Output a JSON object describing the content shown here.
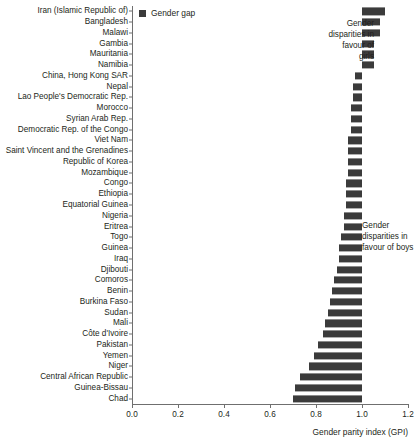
{
  "legend": {
    "label": "Gender gap",
    "swatch_color": "#3b3b3b"
  },
  "annotations": {
    "girls": "Gender disparities in favour of girls",
    "boys": "Gender disparities in favour of boys"
  },
  "axis": {
    "x_title": "Gender parity index (GPI)",
    "x_ticks": [
      "0.0",
      "0.2",
      "0.4",
      "0.6",
      "0.8",
      "1.0",
      "1.2"
    ]
  },
  "chart_data": {
    "type": "bar",
    "orientation": "horizontal",
    "title": "",
    "xlabel": "Gender parity index (GPI)",
    "ylabel": "",
    "xlim": [
      0.0,
      1.2
    ],
    "xticks": [
      0.0,
      0.2,
      0.4,
      0.6,
      0.8,
      1.0,
      1.2
    ],
    "grid": false,
    "legend_position": "top-left",
    "reference_line": 1.0,
    "series_name": "Gender gap",
    "bar_color": "#3b3b3b",
    "note": "Bars are drawn as the gap between the country GPI value and parity (1.00). Values above 1.00 extend right (disparities in favour of girls); values below 1.00 extend left (disparities in favour of boys).",
    "categories": [
      "Iran (Islamic Republic of)",
      "Bangladesh",
      "Malawi",
      "Gambia",
      "Mauritania",
      "Namibia",
      "China, Hong Kong SAR",
      "Nepal",
      "Lao People's Democratic Rep.",
      "Morocco",
      "Syrian Arab Rep.",
      "Democratic Rep. of the Congo",
      "Viet Nam",
      "Saint Vincent and the Grenadines",
      "Republic of Korea",
      "Mozambique",
      "Congo",
      "Ethiopia",
      "Equatorial Guinea",
      "Nigeria",
      "Eritrea",
      "Togo",
      "Guinea",
      "Iraq",
      "Djibouti",
      "Comoros",
      "Benin",
      "Burkina Faso",
      "Sudan",
      "Mali",
      "Côte d'Ivoire",
      "Pakistan",
      "Yemen",
      "Niger",
      "Central African Republic",
      "Guinea-Bissau",
      "Chad"
    ],
    "values": [
      1.1,
      1.08,
      1.08,
      1.05,
      1.05,
      1.05,
      0.97,
      0.96,
      0.96,
      0.95,
      0.95,
      0.95,
      0.94,
      0.94,
      0.94,
      0.94,
      0.93,
      0.93,
      0.93,
      0.92,
      0.92,
      0.91,
      0.9,
      0.9,
      0.89,
      0.88,
      0.87,
      0.86,
      0.85,
      0.84,
      0.83,
      0.81,
      0.79,
      0.77,
      0.73,
      0.71,
      0.7
    ]
  }
}
